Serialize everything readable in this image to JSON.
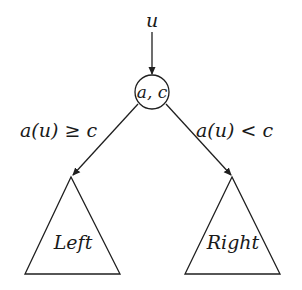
{
  "diagram": {
    "type": "decision-tree-node",
    "input_label": "u",
    "node_label": "a, c",
    "edges": [
      {
        "id": "left",
        "condition": "a(u) ≥ c"
      },
      {
        "id": "right",
        "condition": "a(u) < c"
      }
    ],
    "subtrees": [
      {
        "id": "left",
        "label": "Left"
      },
      {
        "id": "right",
        "label": "Right"
      }
    ],
    "colors": {
      "stroke": "#1f1f1f",
      "background": "#ffffff"
    }
  }
}
